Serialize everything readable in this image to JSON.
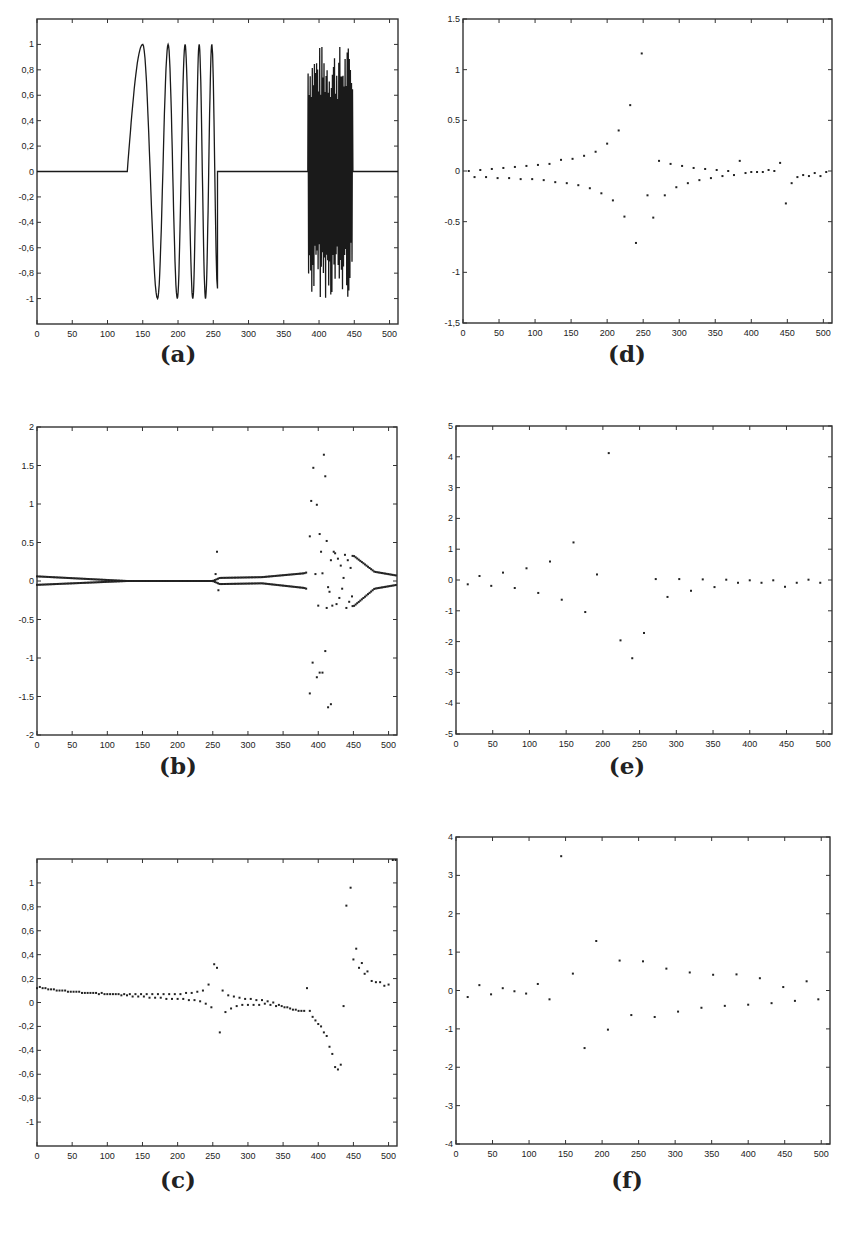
{
  "figure": {
    "panels": [
      {
        "id": "a",
        "caption": "(a)"
      },
      {
        "id": "d",
        "caption": "(d)"
      },
      {
        "id": "b",
        "caption": "(b)"
      },
      {
        "id": "e",
        "caption": "(e)"
      },
      {
        "id": "c",
        "caption": "(c)"
      },
      {
        "id": "f",
        "caption": "(f)"
      }
    ]
  },
  "chart_data": [
    {
      "id": "a",
      "type": "line",
      "title": "",
      "caption": "(a)",
      "xlabel": "",
      "ylabel": "",
      "xlim": [
        0,
        512
      ],
      "ylim": [
        -1.2,
        1.2
      ],
      "xticks": [
        0,
        50,
        100,
        150,
        200,
        250,
        300,
        350,
        400,
        450,
        500
      ],
      "yticks": [
        -1,
        -0.8,
        -0.6,
        -0.4,
        -0.2,
        0,
        0.2,
        0.4,
        0.6,
        0.8,
        1
      ],
      "ytick_labels": [
        "-1",
        "-0,8",
        "-0,6",
        "-0,4",
        "-0,2",
        "0",
        "0,2",
        "0,4",
        "0,6",
        "0,8",
        "1"
      ],
      "grid": false,
      "description": "Signal zero on [0,128]; chirp-like sinusoid of increasing frequency from x=128 to 256 with amplitude 1 (peaks at ~150, 186, 210, 230, 248; troughs at ~171, 199, 221, 239), ending at ~-0.92 near x=256; zero from 256 to ~384; dense high-frequency oscillation of amplitude up to ~1 between x=384 and 448; zero from 448 to 512.",
      "segments": [
        {
          "x_start": 0,
          "x_end": 128,
          "kind": "zero"
        },
        {
          "x_start": 128,
          "x_end": 256,
          "kind": "chirp",
          "peaks_x": [
            150,
            186,
            210,
            230,
            248
          ],
          "troughs_x": [
            171,
            199,
            221,
            239
          ],
          "end_value": -0.92
        },
        {
          "x_start": 256,
          "x_end": 384,
          "kind": "zero"
        },
        {
          "x_start": 384,
          "x_end": 448,
          "kind": "high_freq_noise",
          "amplitude": 1.0
        },
        {
          "x_start": 448,
          "x_end": 512,
          "kind": "zero"
        }
      ]
    },
    {
      "id": "d",
      "type": "scatter",
      "caption": "(d)",
      "xlim": [
        0,
        512
      ],
      "ylim": [
        -1.5,
        1.5
      ],
      "xticks": [
        0,
        50,
        100,
        150,
        200,
        250,
        300,
        350,
        400,
        450,
        500
      ],
      "yticks": [
        -1.5,
        -1,
        -0.5,
        0,
        0.5,
        1,
        1.5
      ],
      "ytick_labels": [
        "-1,5",
        "-1",
        "-0.5",
        "0",
        "0.5",
        "1",
        "1.5"
      ],
      "grid": false,
      "x": [
        8,
        16,
        24,
        32,
        40,
        48,
        56,
        64,
        72,
        80,
        88,
        96,
        104,
        112,
        120,
        128,
        136,
        144,
        152,
        160,
        168,
        176,
        184,
        192,
        200,
        208,
        216,
        224,
        232,
        240,
        248,
        256,
        264,
        272,
        280,
        288,
        296,
        304,
        312,
        320,
        328,
        336,
        344,
        352,
        360,
        368,
        376,
        384,
        392,
        400,
        408,
        416,
        424,
        432,
        440,
        448,
        456,
        464,
        472,
        480,
        488,
        496,
        504
      ],
      "y": [
        0.0,
        -0.06,
        0.01,
        -0.06,
        0.02,
        -0.07,
        0.03,
        -0.07,
        0.04,
        -0.08,
        0.05,
        -0.08,
        0.06,
        -0.09,
        0.07,
        -0.11,
        0.11,
        -0.12,
        0.12,
        -0.14,
        0.15,
        -0.17,
        0.19,
        -0.22,
        0.27,
        -0.29,
        0.4,
        -0.45,
        0.65,
        -0.71,
        1.16,
        -0.24,
        -0.46,
        0.1,
        -0.24,
        0.07,
        -0.16,
        0.05,
        -0.12,
        0.03,
        -0.09,
        0.02,
        -0.07,
        0.01,
        -0.05,
        0.0,
        -0.04,
        0.1,
        -0.02,
        -0.01,
        -0.01,
        -0.01,
        0.01,
        0.0,
        0.08,
        -0.32,
        -0.12,
        -0.06,
        -0.04,
        -0.05,
        -0.02,
        -0.05,
        -0.01
      ]
    },
    {
      "id": "b",
      "type": "scatter",
      "caption": "(b)",
      "xlim": [
        0,
        512
      ],
      "ylim": [
        -2,
        2
      ],
      "xticks": [
        0,
        50,
        100,
        150,
        200,
        250,
        300,
        350,
        400,
        450,
        500
      ],
      "yticks": [
        -2,
        -1.5,
        -1,
        -0.5,
        0,
        0.5,
        1,
        1.5,
        2
      ],
      "ytick_labels": [
        "-2",
        "-1.5",
        "-1",
        "-0.5",
        "0",
        "0.5",
        "1",
        "1.5",
        "2"
      ],
      "grid": false,
      "description": "Two near-symmetric bands of dense points at about ±0.05 from x=0 to 128 converging to 0 near x=128-250; small excursions near x=256 (one point at 0.38); bands at ±0.05..0.1 from 260 to 384; large scattered values between x=384 and 448 (up to ±1.65); decaying bands from ±0.35 at x=450 to ±0.06 at x=512.",
      "sparse_points": {
        "x": [
          256,
          254,
          258,
          388,
          390,
          393,
          396,
          398,
          400,
          402,
          404,
          406,
          408,
          410,
          412,
          414,
          416,
          418,
          420,
          422,
          424,
          426,
          428,
          430,
          432,
          434,
          436,
          438,
          440,
          442,
          444,
          446,
          448,
          392,
          398,
          402,
          406,
          410,
          414,
          418,
          388,
          412
        ],
        "y": [
          0.38,
          0.09,
          -0.12,
          0.58,
          1.04,
          1.47,
          0.09,
          0.99,
          -0.32,
          0.61,
          0.38,
          0.1,
          1.64,
          1.36,
          0.52,
          -0.08,
          -0.14,
          0.27,
          -0.32,
          0.38,
          0.36,
          -0.3,
          0.29,
          -0.22,
          0.2,
          -0.1,
          0.04,
          0.34,
          -0.35,
          0.27,
          -0.27,
          0.17,
          -0.2,
          -1.06,
          -1.25,
          -1.19,
          -1.19,
          -0.91,
          -1.64,
          -1.6,
          -1.46,
          -0.35
        ]
      },
      "band_upper": {
        "x": [
          0,
          128,
          250,
          260,
          320,
          380,
          450,
          480,
          512
        ],
        "y": [
          0.06,
          0.0,
          0.0,
          0.04,
          0.05,
          0.1,
          0.33,
          0.12,
          0.07
        ]
      },
      "band_lower": {
        "x": [
          0,
          128,
          250,
          260,
          320,
          380,
          450,
          480,
          512
        ],
        "y": [
          -0.05,
          0.0,
          0.0,
          -0.04,
          -0.03,
          -0.09,
          -0.33,
          -0.1,
          -0.05
        ]
      }
    },
    {
      "id": "e",
      "type": "scatter",
      "caption": "(e)",
      "xlim": [
        0,
        512
      ],
      "ylim": [
        -5,
        5
      ],
      "xticks": [
        0,
        50,
        100,
        150,
        200,
        250,
        300,
        350,
        400,
        450,
        500
      ],
      "yticks": [
        -5,
        -4,
        -3,
        -2,
        -1,
        0,
        1,
        2,
        3,
        4,
        5
      ],
      "ytick_labels": [
        "-5",
        "-4",
        "-3",
        "-2",
        "-1",
        "0",
        "1",
        "2",
        "3",
        "4",
        "5"
      ],
      "grid": false,
      "x": [
        16,
        32,
        48,
        64,
        80,
        96,
        112,
        128,
        144,
        160,
        176,
        192,
        208,
        224,
        240,
        256,
        272,
        288,
        304,
        320,
        336,
        352,
        368,
        384,
        400,
        416,
        432,
        448,
        464,
        480,
        496
      ],
      "y": [
        -0.14,
        0.13,
        -0.19,
        0.24,
        -0.26,
        0.38,
        -0.42,
        0.6,
        -0.64,
        1.22,
        -1.04,
        0.18,
        4.12,
        -1.96,
        -2.54,
        -1.72,
        0.03,
        -0.55,
        0.03,
        -0.35,
        0.02,
        -0.23,
        0.01,
        -0.09,
        -0.01,
        -0.09,
        -0.01,
        -0.22,
        -0.09,
        0.01,
        -0.09
      ]
    },
    {
      "id": "c",
      "type": "scatter",
      "caption": "(c)",
      "xlim": [
        0,
        512
      ],
      "ylim": [
        -1.2,
        1.2
      ],
      "xticks": [
        0,
        50,
        100,
        150,
        200,
        250,
        300,
        350,
        400,
        450,
        500
      ],
      "yticks": [
        -1,
        -0.8,
        -0.6,
        -0.4,
        -0.2,
        0,
        0.2,
        0.4,
        0.6,
        0.8,
        1
      ],
      "ytick_labels": [
        "-1",
        "-0,8",
        "-0,6",
        "-0,4",
        "-0,2",
        "0",
        "0,2",
        "0,4",
        "0,6",
        "0,8",
        "1"
      ],
      "grid": false,
      "description": "Dense points slowly decaying from 0.13 at x=0 to ~0.07 near x=200, splitting into two branches toward x=256 (upper to 0.32, lower to -0.04); after 256 points from -0.25 rising toward 0 and descending to -0.07 near x=384; then steep descent to -0.56 near x=428; jump to 0.96 near x=446 and decay to ~0.15 at x=512.",
      "x": [
        0,
        4,
        8,
        12,
        16,
        20,
        24,
        28,
        32,
        36,
        40,
        44,
        48,
        52,
        56,
        60,
        64,
        68,
        72,
        76,
        80,
        84,
        88,
        92,
        96,
        100,
        104,
        108,
        112,
        116,
        120,
        124,
        128,
        132,
        136,
        140,
        144,
        148,
        152,
        156,
        160,
        164,
        168,
        172,
        176,
        180,
        184,
        188,
        192,
        196,
        200,
        204,
        208,
        212,
        216,
        220,
        224,
        228,
        232,
        236,
        240,
        244,
        248,
        252,
        256,
        260,
        264,
        268,
        272,
        276,
        280,
        284,
        288,
        292,
        296,
        300,
        304,
        308,
        312,
        316,
        320,
        324,
        328,
        332,
        336,
        340,
        344,
        348,
        352,
        356,
        360,
        364,
        368,
        372,
        376,
        380,
        384,
        388,
        392,
        396,
        400,
        404,
        408,
        412,
        416,
        420,
        424,
        428,
        432,
        436,
        440,
        446,
        450,
        454,
        458,
        462,
        466,
        470,
        476,
        482,
        488,
        494,
        500,
        506,
        510
      ],
      "y": [
        0.12,
        0.13,
        0.12,
        0.12,
        0.11,
        0.11,
        0.11,
        0.1,
        0.1,
        0.1,
        0.1,
        0.09,
        0.09,
        0.09,
        0.09,
        0.09,
        0.08,
        0.08,
        0.08,
        0.08,
        0.08,
        0.08,
        0.07,
        0.08,
        0.07,
        0.07,
        0.07,
        0.07,
        0.07,
        0.07,
        0.06,
        0.07,
        0.06,
        0.07,
        0.05,
        0.07,
        0.05,
        0.07,
        0.05,
        0.07,
        0.04,
        0.07,
        0.04,
        0.07,
        0.04,
        0.07,
        0.03,
        0.07,
        0.03,
        0.07,
        0.03,
        0.07,
        0.03,
        0.08,
        0.02,
        0.08,
        0.02,
        0.09,
        0.01,
        0.1,
        -0.01,
        0.15,
        -0.04,
        0.32,
        0.29,
        -0.25,
        0.1,
        -0.08,
        0.06,
        -0.05,
        0.05,
        -0.03,
        0.04,
        -0.02,
        0.03,
        -0.02,
        0.03,
        -0.02,
        0.02,
        -0.02,
        0.02,
        -0.01,
        0.01,
        -0.02,
        0.0,
        -0.03,
        -0.02,
        -0.03,
        -0.04,
        -0.04,
        -0.05,
        -0.06,
        -0.06,
        -0.07,
        -0.07,
        -0.07,
        0.12,
        -0.07,
        -0.12,
        -0.15,
        -0.18,
        -0.2,
        -0.25,
        -0.28,
        -0.37,
        -0.43,
        -0.54,
        -0.56,
        -0.52,
        -0.03,
        0.81,
        0.96,
        0.36,
        0.45,
        0.29,
        0.33,
        0.24,
        0.26,
        0.18,
        0.17,
        0.17,
        0.14,
        0.15
      ]
    },
    {
      "id": "f",
      "type": "scatter",
      "caption": "(f)",
      "xlim": [
        0,
        512
      ],
      "ylim": [
        -4,
        4
      ],
      "xticks": [
        0,
        50,
        100,
        150,
        200,
        250,
        300,
        350,
        400,
        450,
        500
      ],
      "yticks": [
        -4,
        -3,
        -2,
        -1,
        0,
        1,
        2,
        3,
        4
      ],
      "ytick_labels": [
        "-4",
        "-3",
        "-2",
        "-1",
        "0",
        "1",
        "2",
        "3",
        "4"
      ],
      "grid": false,
      "x": [
        16,
        32,
        48,
        64,
        80,
        96,
        112,
        128,
        144,
        160,
        176,
        192,
        208,
        224,
        240,
        256,
        272,
        288,
        304,
        320,
        336,
        352,
        368,
        384,
        400,
        416,
        432,
        448,
        464,
        480,
        496
      ],
      "y": [
        -0.17,
        0.14,
        -0.1,
        0.06,
        -0.02,
        -0.08,
        0.17,
        -0.23,
        3.5,
        0.44,
        -1.5,
        1.29,
        -1.02,
        0.78,
        -0.64,
        0.76,
        -0.69,
        0.57,
        -0.55,
        0.47,
        -0.45,
        0.41,
        -0.4,
        0.42,
        -0.37,
        0.32,
        -0.33,
        0.09,
        -0.27,
        0.24,
        -0.23
      ]
    }
  ],
  "layout_frames": {
    "a": {
      "left": 37,
      "top": 19,
      "right": 398,
      "bottom": 324,
      "caption_x": 178,
      "caption_y": 356
    },
    "d": {
      "left": 463,
      "top": 19,
      "right": 832,
      "bottom": 323,
      "caption_x": 627,
      "caption_y": 356
    },
    "b": {
      "left": 37,
      "top": 427,
      "right": 397,
      "bottom": 735,
      "caption_x": 178,
      "caption_y": 768
    },
    "e": {
      "left": 456,
      "top": 426,
      "right": 832,
      "bottom": 734,
      "caption_x": 627,
      "caption_y": 768
    },
    "c": {
      "left": 37,
      "top": 859,
      "right": 397,
      "bottom": 1146,
      "caption_x": 178,
      "caption_y": 1182
    },
    "f": {
      "left": 456,
      "top": 837,
      "right": 830,
      "bottom": 1144,
      "caption_x": 627,
      "caption_y": 1182
    }
  }
}
